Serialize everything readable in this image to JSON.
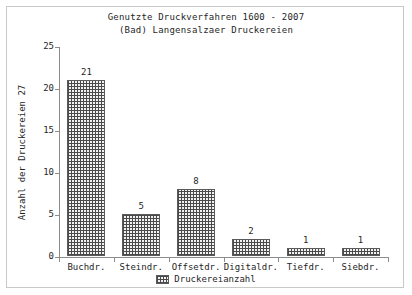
{
  "chart_data": {
    "type": "bar",
    "title": "Genutzte Druckverfahren 1600 - 2007",
    "subtitle": "(Bad) Langensalzaer Druckereien",
    "categories": [
      "Buchdr.",
      "Steindr.",
      "Offsetdr.",
      "Digitaldr.",
      "Tiefdr.",
      "Siebdr."
    ],
    "values": [
      21,
      5,
      8,
      2,
      1,
      1
    ],
    "value_labels": [
      "21",
      "5",
      "8",
      "2",
      "1",
      "1"
    ],
    "series": [
      {
        "name": "Druckereianzahl",
        "values": [
          21,
          5,
          8,
          2,
          1,
          1
        ]
      }
    ],
    "xlabel": "",
    "ylabel": "Anzahl der Druckereien 27",
    "ylim": [
      0,
      25
    ],
    "yticks": [
      0,
      5,
      10,
      15,
      20,
      25
    ],
    "ytick_labels": [
      "0",
      "5",
      "10",
      "15",
      "20",
      "25"
    ],
    "grid": false,
    "legend_position": "bottom-center",
    "legend_entries": [
      "Druckereianzahl"
    ],
    "colors": {
      "bar_pattern": "#4a4a4a",
      "bar_fill": "#f2f2f2",
      "bar_border": "#5a5a5a",
      "axis": "#8c8c8c",
      "text": "#1f1f1f",
      "frame": "#c8c8c8",
      "background": "#ffffff"
    }
  },
  "legend": {
    "label": "Druckereianzahl"
  }
}
